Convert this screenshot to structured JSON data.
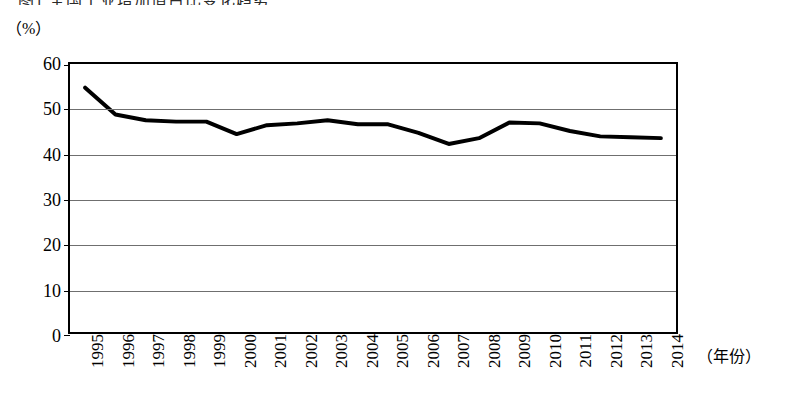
{
  "figure": {
    "title_clipped": "图1 全国工业增加值占比变化趋势",
    "y_unit_label": "（%）",
    "x_unit_label": "（年份）"
  },
  "chart_data": {
    "type": "line",
    "title": "",
    "xlabel": "（年份）",
    "ylabel": "（%）",
    "ylim": [
      0,
      60
    ],
    "yticks": [
      0,
      10,
      20,
      30,
      40,
      50,
      60
    ],
    "grid": true,
    "legend": false,
    "categories": [
      "1995",
      "1996",
      "1997",
      "1998",
      "1999",
      "2000",
      "2001",
      "2002",
      "2003",
      "2004",
      "2005",
      "2006",
      "2007",
      "2008",
      "2009",
      "2010",
      "2011",
      "2012",
      "2013",
      "2014"
    ],
    "values": [
      54.7,
      48.7,
      47.4,
      47.1,
      47.1,
      44.3,
      46.3,
      46.7,
      47.4,
      46.5,
      46.5,
      44.6,
      42.1,
      43.4,
      46.9,
      46.7,
      45.0,
      43.8,
      43.6,
      43.4
    ],
    "series": [
      {
        "name": "占比",
        "color": "#000000",
        "values": [
          54.7,
          48.7,
          47.4,
          47.1,
          47.1,
          44.3,
          46.3,
          46.7,
          47.4,
          46.5,
          46.5,
          44.6,
          42.1,
          43.4,
          46.9,
          46.7,
          45.0,
          43.8,
          43.6,
          43.4
        ]
      }
    ]
  },
  "colors": {
    "line": "#000000",
    "grid": "#6f6f6f",
    "frame": "#000000",
    "background": "#ffffff"
  }
}
